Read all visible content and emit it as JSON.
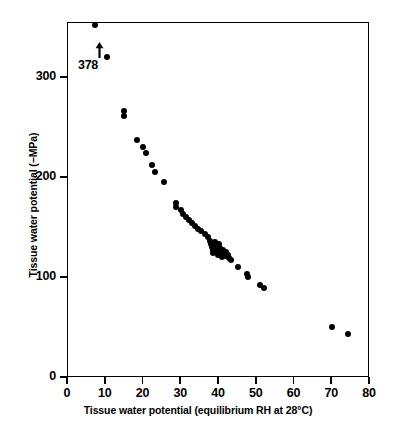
{
  "chart_data": {
    "type": "scatter",
    "title": "",
    "xlabel": "Tissue water potential (equilibrium RH at 28°C)",
    "ylabel": "Tissue water potential (−MPa)",
    "xlim": [
      0,
      80
    ],
    "ylim": [
      0,
      355
    ],
    "xticks": [
      0,
      10,
      20,
      30,
      40,
      50,
      60,
      70,
      80
    ],
    "yticks": [
      0,
      100,
      200,
      300
    ],
    "xtick_labels": [
      "0",
      "10",
      "20",
      "30",
      "40",
      "50",
      "60",
      "70",
      "80"
    ],
    "ytick_labels": [
      "0",
      "100",
      "200",
      "300"
    ],
    "grid": false,
    "legend": null,
    "marker": "filled-circle",
    "marker_color": "#000000",
    "annotations": [
      {
        "text": "378",
        "type": "off-scale-value",
        "arrow": "up",
        "x": 7.5,
        "y": 352,
        "note": "arrow with value 378 marks a point above the plotted axis range"
      }
    ],
    "points": [
      {
        "x": 7.5,
        "y": 352
      },
      {
        "x": 10.6,
        "y": 320
      },
      {
        "x": 15.2,
        "y": 266
      },
      {
        "x": 15.2,
        "y": 261
      },
      {
        "x": 18.6,
        "y": 237
      },
      {
        "x": 20.0,
        "y": 230
      },
      {
        "x": 20.8,
        "y": 224
      },
      {
        "x": 22.6,
        "y": 212
      },
      {
        "x": 23.4,
        "y": 205
      },
      {
        "x": 25.6,
        "y": 195
      },
      {
        "x": 29.0,
        "y": 174
      },
      {
        "x": 29.0,
        "y": 170
      },
      {
        "x": 30.2,
        "y": 167
      },
      {
        "x": 30.6,
        "y": 163
      },
      {
        "x": 31.4,
        "y": 160
      },
      {
        "x": 32.2,
        "y": 157
      },
      {
        "x": 33.0,
        "y": 154
      },
      {
        "x": 33.8,
        "y": 151
      },
      {
        "x": 34.8,
        "y": 148
      },
      {
        "x": 35.6,
        "y": 146
      },
      {
        "x": 36.6,
        "y": 143
      },
      {
        "x": 37.4,
        "y": 140
      },
      {
        "x": 38.0,
        "y": 136
      },
      {
        "x": 38.2,
        "y": 133
      },
      {
        "x": 38.4,
        "y": 130
      },
      {
        "x": 38.6,
        "y": 127
      },
      {
        "x": 38.8,
        "y": 124
      },
      {
        "x": 39.2,
        "y": 135
      },
      {
        "x": 39.4,
        "y": 131
      },
      {
        "x": 39.6,
        "y": 128
      },
      {
        "x": 39.8,
        "y": 125
      },
      {
        "x": 40.0,
        "y": 122
      },
      {
        "x": 40.2,
        "y": 133
      },
      {
        "x": 40.4,
        "y": 129
      },
      {
        "x": 40.6,
        "y": 126
      },
      {
        "x": 40.8,
        "y": 123
      },
      {
        "x": 41.0,
        "y": 120
      },
      {
        "x": 41.4,
        "y": 127
      },
      {
        "x": 41.6,
        "y": 124
      },
      {
        "x": 41.8,
        "y": 121
      },
      {
        "x": 42.2,
        "y": 125
      },
      {
        "x": 42.6,
        "y": 122
      },
      {
        "x": 43.0,
        "y": 119
      },
      {
        "x": 43.4,
        "y": 117
      },
      {
        "x": 45.2,
        "y": 110
      },
      {
        "x": 47.8,
        "y": 103
      },
      {
        "x": 48.0,
        "y": 100
      },
      {
        "x": 51.0,
        "y": 92
      },
      {
        "x": 52.2,
        "y": 89
      },
      {
        "x": 70.2,
        "y": 50
      },
      {
        "x": 74.4,
        "y": 43
      }
    ]
  }
}
